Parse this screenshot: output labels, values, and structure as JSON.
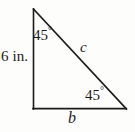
{
  "figure": {
    "name": "right-triangle-45-45-90",
    "background_color": "#fdfdfc",
    "stroke_color": "#1a1a1a",
    "text_color": "#1a1a1a",
    "vertices": {
      "top": {
        "x": 33,
        "y": 9
      },
      "bottom_left": {
        "x": 33,
        "y": 109
      },
      "bottom_right": {
        "x": 126,
        "y": 109
      }
    },
    "labels": {
      "leg_vertical": "6 in.",
      "leg_horizontal": "b",
      "hypotenuse": "c",
      "angle_top_value": "45",
      "angle_top_unit": "°",
      "angle_bottom_right_value": "45",
      "angle_bottom_right_unit": "°"
    }
  }
}
